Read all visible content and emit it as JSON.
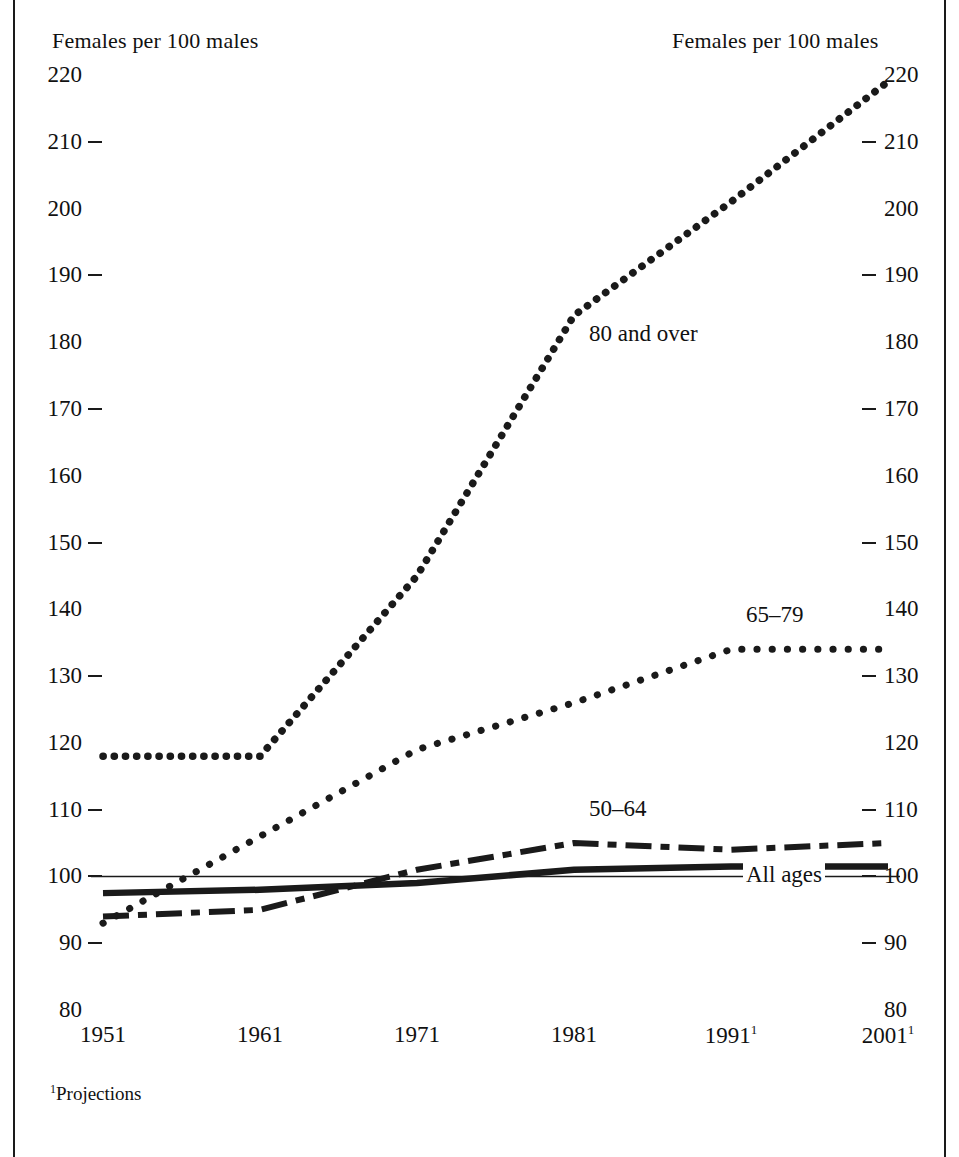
{
  "figure": {
    "axis_caption_left": "Females per 100 males",
    "axis_caption_right": "Females per 100 males",
    "footnote_marker": "1",
    "footnote_text": "Projections",
    "line_color": "#1a1a1a",
    "reference_line_value": 100
  },
  "chart_data": {
    "type": "line",
    "title": "Females per 100 males",
    "xlabel": "",
    "ylabel": "Females per 100 males",
    "x": [
      "1951",
      "1961",
      "1971",
      "1981",
      "1991",
      "2001"
    ],
    "x_footnote_flags": [
      false,
      false,
      false,
      false,
      true,
      true
    ],
    "ylim": [
      80,
      220
    ],
    "yticks": [
      80,
      90,
      100,
      110,
      120,
      130,
      140,
      150,
      160,
      170,
      180,
      190,
      200,
      210,
      220
    ],
    "ytick_has_dash": [
      false,
      true,
      true,
      true,
      false,
      true,
      false,
      true,
      false,
      true,
      false,
      true,
      false,
      true,
      false
    ],
    "grid": false,
    "legend": "inline-labels",
    "reference_lines": [
      {
        "value": 100,
        "style": "thin-solid"
      }
    ],
    "series": [
      {
        "name": "80 and over",
        "label": "80 and over",
        "style": "dotted-heavy",
        "label_x": "1981",
        "label_y": 181,
        "values": [
          118,
          118,
          145,
          184,
          201,
          219
        ]
      },
      {
        "name": "65-79",
        "label": "65–79",
        "style": "dotted",
        "label_x": "1991",
        "label_y": 139,
        "values": [
          93,
          106,
          119,
          126,
          134,
          134
        ]
      },
      {
        "name": "50-64",
        "label": "50–64",
        "style": "dash-dot",
        "label_x": "1981",
        "label_y": 110,
        "values": [
          94,
          95,
          101,
          105,
          104,
          105
        ]
      },
      {
        "name": "All ages",
        "label": "All ages",
        "style": "solid-heavy",
        "label_x": "1991",
        "label_y": 100,
        "values": [
          97.5,
          98,
          99,
          101,
          101.5,
          101.5
        ]
      }
    ]
  }
}
